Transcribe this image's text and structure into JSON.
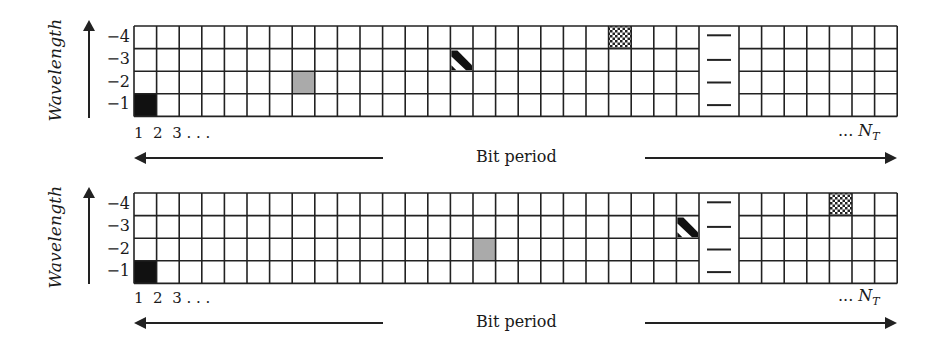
{
  "diagram": {
    "y_axis_label": "Wavelength",
    "row_labels": [
      "−4",
      "−3",
      "−2",
      "−1"
    ],
    "index_labels": "1  2  3 . . .",
    "end_label_prefix": "... ",
    "end_label_var": "N",
    "end_label_sub": "T",
    "x_axis_label": "Bit period",
    "colors": {
      "grid_line": "#222222",
      "black_fill": "#111111",
      "gray_fill": "#aaaaaa"
    },
    "grid_spec": {
      "rows": 4,
      "cells_before_gap": 25,
      "cells_after_gap": 7,
      "gap_marker": "—"
    },
    "panels": [
      {
        "name": "top-panel",
        "marked_cells": [
          {
            "pattern": "black",
            "column": 1,
            "wavelength": "−1"
          },
          {
            "pattern": "gray",
            "column": 8,
            "wavelength": "−2"
          },
          {
            "pattern": "diagonal-stripe",
            "column": 15,
            "wavelength": "−3"
          },
          {
            "pattern": "crosshatch",
            "column": 22,
            "wavelength": "−4"
          }
        ]
      },
      {
        "name": "bottom-panel",
        "marked_cells": [
          {
            "pattern": "black",
            "column": 1,
            "wavelength": "−1"
          },
          {
            "pattern": "gray",
            "column": 16,
            "wavelength": "−2"
          },
          {
            "pattern": "diagonal-stripe",
            "column": 25,
            "wavelength": "−3"
          },
          {
            "pattern": "crosshatch",
            "column": "after-gap 5",
            "wavelength": "−4"
          }
        ]
      }
    ]
  }
}
